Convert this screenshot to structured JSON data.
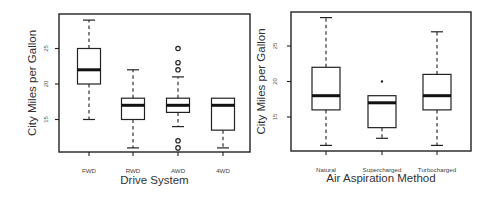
{
  "chart_data": [
    {
      "type": "box",
      "title": "",
      "xlabel": "Drive System",
      "ylabel": "City Miles per Gallon",
      "yticks": [
        15,
        20,
        25
      ],
      "ylim": [
        10,
        30
      ],
      "grid": false,
      "categories": [
        "FWD",
        "RWD",
        "AWD",
        "4WD"
      ],
      "series": [
        {
          "name": "FWD",
          "whisker_low": 15,
          "q1": 20,
          "median": 22,
          "q3": 25,
          "whisker_high": 29,
          "outliers": []
        },
        {
          "name": "RWD",
          "whisker_low": 11,
          "q1": 15,
          "median": 17,
          "q3": 18,
          "whisker_high": 22,
          "outliers": []
        },
        {
          "name": "AWD",
          "whisker_low": 14,
          "q1": 16,
          "median": 17,
          "q3": 18,
          "whisker_high": 21,
          "outliers": [
            11,
            12,
            22,
            23,
            25
          ]
        },
        {
          "name": "4WD",
          "whisker_low": 11,
          "q1": 13.5,
          "median": 17,
          "q3": 18,
          "whisker_high": 18,
          "outliers": []
        }
      ]
    },
    {
      "type": "box",
      "title": "",
      "xlabel": "Air Aspiration Method",
      "ylabel": "City Miles per Gallon",
      "yticks": [
        15,
        20,
        25
      ],
      "ylim": [
        10,
        30
      ],
      "grid": false,
      "categories": [
        "Natural",
        "Supercharged",
        "Turbocharged"
      ],
      "series": [
        {
          "name": "Natural",
          "whisker_low": 11,
          "q1": 16,
          "median": 18,
          "q3": 22,
          "whisker_high": 29,
          "outliers": []
        },
        {
          "name": "Supercharged",
          "whisker_low": 12,
          "q1": 13.5,
          "median": 17,
          "q3": 18,
          "whisker_high": 18,
          "outliers": [
            20
          ]
        },
        {
          "name": "Turbocharged",
          "whisker_low": 11,
          "q1": 16,
          "median": 18,
          "q3": 21,
          "whisker_high": 27,
          "outliers": []
        }
      ]
    }
  ],
  "layout": [
    {
      "frame": {
        "x0": 59,
        "y0": 14,
        "x1": 250,
        "y1": 152
      },
      "y_ref": {
        "value": 20,
        "py": 84
      },
      "px_per_unit": 7.1,
      "xpos": [
        89,
        133,
        178,
        223
      ],
      "box_half": 11.5,
      "cap_half": 6,
      "xlabel_y": 184,
      "cat_y": 173,
      "ylabel_x": 36,
      "tick_x": 48
    },
    {
      "frame": {
        "x0": 291,
        "y0": 12,
        "x1": 471,
        "y1": 151
      },
      "y_ref": {
        "value": 20,
        "py": 81.5
      },
      "px_per_unit": 7.1,
      "xpos": [
        326,
        382,
        437
      ],
      "box_half": 14,
      "cap_half": 6,
      "xlabel_y": 182,
      "cat_y": 172,
      "ylabel_x": 265,
      "tick_x": 277
    }
  ]
}
